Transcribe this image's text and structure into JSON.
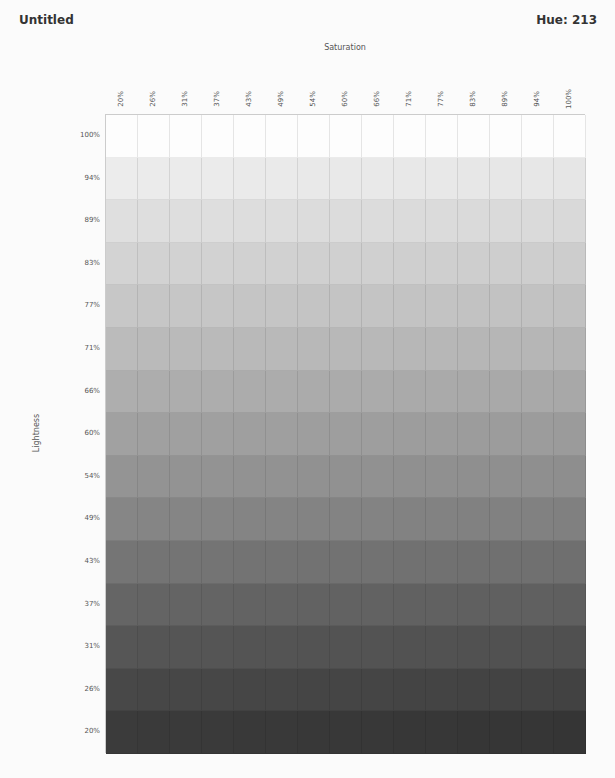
{
  "header": {
    "title": "Untitled",
    "hue_label": "Hue: 213"
  },
  "chart_data": {
    "type": "heatmap",
    "title": "Untitled",
    "subtitle": "Hue: 213",
    "hue": 213,
    "xlabel": "Saturation",
    "ylabel": "Lightness",
    "x": [
      "20%",
      "26%",
      "31%",
      "37%",
      "43%",
      "49%",
      "54%",
      "60%",
      "66%",
      "71%",
      "77%",
      "83%",
      "89%",
      "94%",
      "100%"
    ],
    "y": [
      "100%",
      "94%",
      "89%",
      "83%",
      "77%",
      "71%",
      "66%",
      "60%",
      "54%",
      "49%",
      "43%",
      "37%",
      "31%",
      "26%",
      "20%"
    ],
    "row_gray_values": [
      "#fdfdfd",
      "#e9e9e9",
      "#dcdcdc",
      "#d0d0d0",
      "#c4c4c4",
      "#b8b8b8",
      "#ababab",
      "#9e9e9e",
      "#919191",
      "#838383",
      "#727272",
      "#626262",
      "#535353",
      "#454545",
      "#383838"
    ],
    "grid": true,
    "legend": "none"
  }
}
